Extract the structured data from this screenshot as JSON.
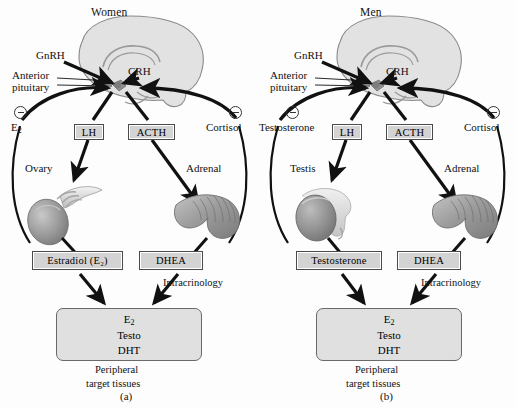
{
  "figure": {
    "background_color": "#fdfdfd",
    "box_fill": "#d3d3d3",
    "target_fill": "#e0e0e0",
    "organ_fill": "#9a9a9a",
    "brain_fill": "#e2e2e2"
  },
  "panels": [
    {
      "id": "women",
      "title": "Women",
      "caption": "(a)",
      "brain_labels": {
        "gnrh": "GnRH",
        "crh": "CRH",
        "anterior": "Anterior",
        "pituitary": "pituitary"
      },
      "feedback_left": {
        "sign": "−",
        "label": "E",
        "sub": "2",
        "icon": "minus-circle-icon"
      },
      "feedback_right": {
        "sign": "−",
        "label": "Cortisol",
        "icon": "minus-circle-icon"
      },
      "tropic_left": "LH",
      "tropic_right": "ACTH",
      "organ_left": "Ovary",
      "organ_right": "Adrenal",
      "steroid_left": "Estradiol (E₂)",
      "steroid_right": "DHEA",
      "intracrinology": "Intracrinology",
      "target": {
        "line1": "E₂",
        "line2": "Testo",
        "line3": "DHT",
        "caption1": "Peripheral",
        "caption2": "target tissues"
      }
    },
    {
      "id": "men",
      "title": "Men",
      "caption": "(b)",
      "brain_labels": {
        "gnrh": "GnRH",
        "crh": "CRH",
        "anterior": "Anterior",
        "pituitary": "pituitary"
      },
      "feedback_left": {
        "sign": "−",
        "label": "Testosterone",
        "sub": "",
        "icon": "minus-circle-icon"
      },
      "feedback_right": {
        "sign": "−",
        "label": "Cortisol",
        "icon": "minus-circle-icon"
      },
      "tropic_left": "LH",
      "tropic_right": "ACTH",
      "organ_left": "Testis",
      "organ_right": "Adrenal",
      "steroid_left": "Testosterone",
      "steroid_right": "DHEA",
      "intracrinology": "Intracrinology",
      "target": {
        "line1": "E₂",
        "line2": "Testo",
        "line3": "DHT",
        "caption1": "Peripheral",
        "caption2": "target tissues"
      }
    }
  ]
}
